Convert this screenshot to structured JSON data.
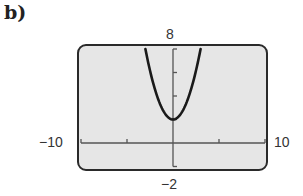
{
  "part_label": "b)",
  "window": {
    "xmin_label": "−10",
    "xmax_label": "10",
    "ymin_label": "−2",
    "ymax_label": "8"
  },
  "colors": {
    "screen_fill": "#e6e6e6",
    "border": "#2a2a2a",
    "curve": "#1a1a1a",
    "axis": "#555555"
  },
  "chart_data": {
    "type": "line",
    "title": "",
    "xlabel": "",
    "ylabel": "",
    "xlim": [
      -10,
      10
    ],
    "ylim": [
      -2,
      8
    ],
    "x_ticks": [
      -10,
      -5,
      0,
      5,
      10
    ],
    "y_ticks": [
      -2,
      0,
      2,
      4,
      6,
      8
    ],
    "tick_labels": {
      "x": [
        "-10",
        "10"
      ],
      "y": [
        "-2",
        "8"
      ]
    },
    "grid": false,
    "legend": null,
    "series": [
      {
        "name": "parabola",
        "equation_approx": "y = (2/3)x^2 + 2",
        "x": [
          -3,
          -2.5,
          -2,
          -1.5,
          -1,
          -0.5,
          0,
          0.5,
          1,
          1.5,
          2,
          2.5,
          3
        ],
        "y": [
          8,
          6.17,
          4.67,
          3.5,
          2.67,
          2.17,
          2,
          2.17,
          2.67,
          3.5,
          4.67,
          6.17,
          8
        ]
      }
    ],
    "vertex": [
      0,
      2
    ]
  }
}
